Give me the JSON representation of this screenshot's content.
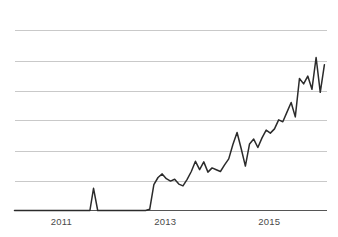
{
  "chart_data": {
    "type": "line",
    "title": "",
    "subtitle": "",
    "xlabel": "",
    "ylabel": "",
    "grid": true,
    "legend": null,
    "legend_position": "none",
    "colors": {
      "series_line": "#2b2b2b",
      "gridline": "#c9c9c9",
      "axis": "#555555",
      "tick_label": "#4a4a4a",
      "background": "#ffffff"
    },
    "xlim": [
      2010.1,
      2016.1
    ],
    "ylim": [
      0,
      6.6
    ],
    "x_tick_labels": [
      "2011",
      "2013",
      "2015"
    ],
    "x_tick_values": [
      2011,
      2013,
      2015
    ],
    "y_gridline_values": [
      0,
      1,
      2,
      3,
      4,
      5,
      6
    ],
    "y_tick_labels": [],
    "series": [
      {
        "name": "series-1",
        "x": [
          2010.1,
          2010.25,
          2010.4,
          2010.55,
          2010.7,
          2010.85,
          2011.0,
          2011.15,
          2011.3,
          2011.45,
          2011.55,
          2011.62,
          2011.7,
          2011.78,
          2011.9,
          2012.05,
          2012.2,
          2012.35,
          2012.5,
          2012.62,
          2012.7,
          2012.78,
          2012.86,
          2012.94,
          2013.02,
          2013.1,
          2013.18,
          2013.26,
          2013.34,
          2013.42,
          2013.5,
          2013.58,
          2013.66,
          2013.74,
          2013.82,
          2013.9,
          2013.98,
          2014.06,
          2014.14,
          2014.22,
          2014.3,
          2014.38,
          2014.46,
          2014.54,
          2014.62,
          2014.7,
          2014.78,
          2014.86,
          2014.94,
          2015.02,
          2015.1,
          2015.18,
          2015.26,
          2015.34,
          2015.42,
          2015.5,
          2015.58,
          2015.66,
          2015.74,
          2015.82,
          2015.9,
          2015.98,
          2016.06
        ],
        "y": [
          0.0,
          0.0,
          0.0,
          0.0,
          0.0,
          0.0,
          0.0,
          0.0,
          0.0,
          0.0,
          0.0,
          0.74,
          0.0,
          0.0,
          0.0,
          0.0,
          0.0,
          0.0,
          0.0,
          0.0,
          0.04,
          0.86,
          1.1,
          1.22,
          1.06,
          0.98,
          1.04,
          0.88,
          0.82,
          1.04,
          1.3,
          1.64,
          1.36,
          1.62,
          1.28,
          1.42,
          1.36,
          1.3,
          1.52,
          1.72,
          2.2,
          2.6,
          2.06,
          1.48,
          2.22,
          2.38,
          2.1,
          2.42,
          2.68,
          2.58,
          2.72,
          3.02,
          2.96,
          3.28,
          3.6,
          3.12,
          4.4,
          4.22,
          4.48,
          4.04,
          5.1,
          3.94,
          4.86
        ],
        "color": "#2b2b2b"
      }
    ],
    "annotations": []
  }
}
